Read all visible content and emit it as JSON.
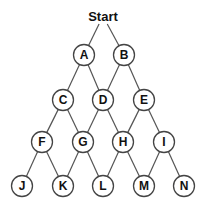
{
  "diagram": {
    "type": "lattice-tree",
    "root": {
      "id": "Start",
      "label": "Start",
      "x": 103,
      "y": 16
    },
    "node_radius": 10.5,
    "colors": {
      "stroke": "#444444",
      "edge": "#555555",
      "text": "#111111",
      "background": "#ffffff"
    },
    "nodes": [
      {
        "id": "A",
        "label": "A",
        "x": 84,
        "y": 55
      },
      {
        "id": "B",
        "label": "B",
        "x": 124,
        "y": 55
      },
      {
        "id": "C",
        "label": "C",
        "x": 63,
        "y": 100
      },
      {
        "id": "D",
        "label": "D",
        "x": 103,
        "y": 100
      },
      {
        "id": "E",
        "label": "E",
        "x": 144,
        "y": 100
      },
      {
        "id": "F",
        "label": "F",
        "x": 42,
        "y": 142
      },
      {
        "id": "G",
        "label": "G",
        "x": 83,
        "y": 142
      },
      {
        "id": "H",
        "label": "H",
        "x": 123,
        "y": 142
      },
      {
        "id": "I",
        "label": "I",
        "x": 164,
        "y": 142
      },
      {
        "id": "J",
        "label": "J",
        "x": 22,
        "y": 186
      },
      {
        "id": "K",
        "label": "K",
        "x": 63,
        "y": 186
      },
      {
        "id": "L",
        "label": "L",
        "x": 103,
        "y": 186
      },
      {
        "id": "M",
        "label": "M",
        "x": 144,
        "y": 186
      },
      {
        "id": "N",
        "label": "N",
        "x": 184,
        "y": 186
      }
    ],
    "edges": [
      [
        "Start",
        "A"
      ],
      [
        "Start",
        "B"
      ],
      [
        "A",
        "C"
      ],
      [
        "A",
        "D"
      ],
      [
        "B",
        "D"
      ],
      [
        "B",
        "E"
      ],
      [
        "C",
        "F"
      ],
      [
        "C",
        "G"
      ],
      [
        "D",
        "G"
      ],
      [
        "D",
        "H"
      ],
      [
        "E",
        "H"
      ],
      [
        "E",
        "I"
      ],
      [
        "F",
        "J"
      ],
      [
        "F",
        "K"
      ],
      [
        "G",
        "K"
      ],
      [
        "G",
        "L"
      ],
      [
        "H",
        "L"
      ],
      [
        "H",
        "M"
      ],
      [
        "I",
        "M"
      ],
      [
        "I",
        "N"
      ]
    ]
  }
}
